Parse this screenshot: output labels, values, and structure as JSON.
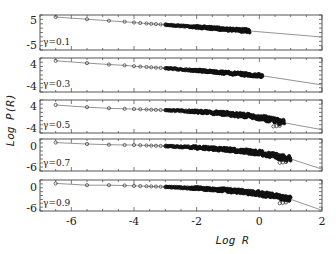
{
  "chart_data": {
    "type": "scatter",
    "title": "",
    "xlabel": "Log R",
    "ylabel": "Log P(R)",
    "xlim": [
      -7,
      2
    ],
    "xticks": [
      -6,
      -4,
      -2,
      0,
      2
    ],
    "grid": false,
    "legend": "none",
    "layout": "5 stacked panels sharing x-axis",
    "marker": "open circles (data) + solid gray line (fit)",
    "panels": [
      {
        "label": "γ=0.1",
        "ylim": [
          -7,
          7
        ],
        "yticks": [
          5,
          -5
        ],
        "data_xmax": -0.3,
        "points": {
          "x": [
            -6.5,
            -5.5,
            -4.8,
            -4.3,
            -4.0,
            -3.7,
            -3.0,
            -2.0,
            -1.0,
            -0.3
          ],
          "y": [
            6.2,
            5.3,
            4.7,
            4.3,
            4.0,
            3.7,
            3.1,
            2.2,
            1.3,
            0.6
          ]
        },
        "fit_end": {
          "x": 2,
          "y": -1.8
        }
      },
      {
        "label": "γ=0.3",
        "ylim": [
          -6,
          6
        ],
        "yticks": [
          4,
          -4
        ],
        "data_xmax": 0.1,
        "points": {
          "x": [
            -6.5,
            -5.5,
            -4.8,
            -4.3,
            -4.0,
            -3.0,
            -2.0,
            -1.0,
            0.1
          ],
          "y": [
            5.0,
            4.2,
            3.7,
            3.4,
            3.1,
            2.4,
            1.6,
            0.7,
            -0.3
          ]
        },
        "fit_end": {
          "x": 2,
          "y": -3.5
        }
      },
      {
        "label": "γ=0.5",
        "ylim": [
          -6,
          6
        ],
        "yticks": [
          4,
          -4
        ],
        "data_xmax": 0.8,
        "points": {
          "x": [
            -6.5,
            -5.5,
            -4.8,
            -4.3,
            -4.0,
            -3.0,
            -2.0,
            -1.0,
            0.0,
            0.8
          ],
          "y": [
            4.2,
            3.4,
            3.0,
            2.8,
            2.7,
            2.3,
            1.8,
            1.0,
            -0.3,
            -2.3
          ]
        },
        "fit_end": {
          "x": 2,
          "y": -4.8
        }
      },
      {
        "label": "γ=0.7",
        "ylim": [
          -7,
          2
        ],
        "yticks": [
          0,
          -6
        ],
        "data_xmax": 1.0,
        "points": {
          "x": [
            -6.5,
            -5.5,
            -4.8,
            -4.3,
            -4.0,
            -3.0,
            -2.0,
            -1.0,
            0.0,
            1.0
          ],
          "y": [
            1.0,
            0.6,
            0.4,
            0.3,
            0.3,
            0.0,
            -0.4,
            -1.0,
            -1.9,
            -3.6
          ]
        },
        "fit_end": {
          "x": 2,
          "y": -6.5
        }
      },
      {
        "label": "γ=0.9",
        "ylim": [
          -7,
          2
        ],
        "yticks": [
          0,
          -6
        ],
        "data_xmax": 1.0,
        "points": {
          "x": [
            -6.5,
            -5.5,
            -4.8,
            -4.3,
            -4.0,
            -3.0,
            -2.0,
            -1.0,
            0.0,
            1.0
          ],
          "y": [
            1.0,
            0.5,
            0.5,
            0.4,
            0.3,
            0.0,
            -0.4,
            -1.0,
            -1.9,
            -3.6
          ]
        },
        "fit_end": {
          "x": 2,
          "y": -6.8
        }
      }
    ]
  },
  "labels": {
    "xlabel": "Log R",
    "ylabel": "Log P(R)",
    "xticks": [
      "-6",
      "-4",
      "-2",
      "0",
      "2"
    ]
  }
}
